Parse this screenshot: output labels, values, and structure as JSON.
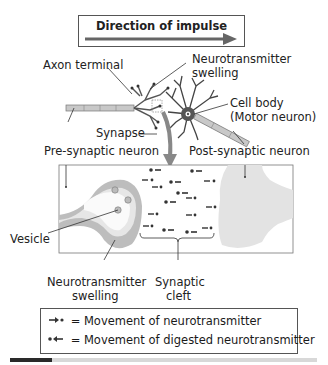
{
  "direction": {
    "title": "Direction of impulse",
    "arrow_color": "#666666"
  },
  "labels": {
    "axon_terminal": "Axon terminal",
    "nt_swelling_top_line1": "Neurotransmitter",
    "nt_swelling_top_line2": "swelling",
    "cell_body_line1": "Cell body",
    "cell_body_line2": "(Motor neuron)",
    "synapse": "Synapse",
    "pre_synaptic": "Pre-synaptic neuron",
    "post_synaptic": "Post-synaptic neuron",
    "vesicle": "Vesicle",
    "nt_swelling_bottom_line1": "Neurotransmitter",
    "nt_swelling_bottom_line2": "swelling",
    "synaptic_cleft_line1": "Synaptic",
    "synaptic_cleft_line2": "cleft"
  },
  "legend": {
    "items": [
      {
        "symbol": "arrow-right-dot",
        "text": "= Movement of neurotransmitter"
      },
      {
        "symbol": "dot-arrow-left",
        "text": "= Movement of digested neurotransmitter"
      }
    ]
  },
  "colors": {
    "neuron_fill": "#b8b8b8",
    "cell_body": "#555555",
    "pre_terminal_outer": "#bdbdbd",
    "pre_terminal_inner": "#e6e6e6",
    "post_terminal": "#e3e3e3",
    "arrow_down": "#888888"
  }
}
